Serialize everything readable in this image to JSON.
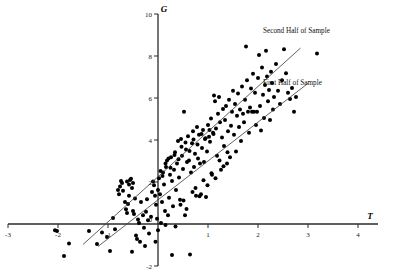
{
  "chart_data": {
    "type": "scatter",
    "title": "",
    "xlabel": "T",
    "ylabel": "G",
    "xlim": [
      -3,
      4
    ],
    "ylim": [
      -2,
      10
    ],
    "xticks": [
      -3,
      -2,
      -1,
      0,
      1,
      2,
      3,
      4
    ],
    "yticks": [
      -2,
      0,
      2,
      4,
      6,
      8,
      10
    ],
    "xtick_labels": [
      "-3",
      "-2",
      "-1",
      "0",
      "1",
      "2",
      "3",
      "4"
    ],
    "ytick_labels": [
      "-2",
      "0",
      "2",
      "4",
      "6",
      "8",
      "10"
    ],
    "grid": false,
    "legend_position": "in-plot-right",
    "series": [
      {
        "name": "Second Half of Sample",
        "type": "line",
        "kind": "regression-fit",
        "slope": 2.15,
        "intercept": 2.25,
        "x_start": -1.5,
        "x_end": 2.85,
        "label_x": 2.1,
        "label_y": 9.1
      },
      {
        "name": "First Half of Sample",
        "type": "line",
        "kind": "regression-fit",
        "slope": 1.85,
        "intercept": 1.15,
        "x_start": -1.2,
        "x_end": 3.0,
        "label_x": 2.1,
        "label_y": 6.6
      },
      {
        "name": "observations",
        "type": "scatter",
        "marker": "filled-circle",
        "color": "#000000",
        "points": [
          [
            -2.02,
            -0.33
          ],
          [
            -1.78,
            -0.93
          ],
          [
            -2.06,
            -0.3
          ],
          [
            -1.38,
            -0.33
          ],
          [
            -1.22,
            -0.95
          ],
          [
            -1.12,
            -0.4
          ],
          [
            -1.02,
            -0.62
          ],
          [
            -0.96,
            -1.28
          ],
          [
            -0.9,
            0.28
          ],
          [
            -0.86,
            -0.25
          ],
          [
            -0.8,
            1.62
          ],
          [
            -0.78,
            1.42
          ],
          [
            -0.76,
            1.78
          ],
          [
            -0.74,
            2.05
          ],
          [
            -0.72,
            1.95
          ],
          [
            -0.7,
            1.58
          ],
          [
            -0.66,
            1.05
          ],
          [
            -0.64,
            0.7
          ],
          [
            -0.62,
            0.52
          ],
          [
            -0.6,
            0.95
          ],
          [
            -0.58,
            1.35
          ],
          [
            -0.56,
            2.1
          ],
          [
            -0.52,
            1.72
          ],
          [
            -0.5,
            0.62
          ],
          [
            -0.48,
            0.48
          ],
          [
            -0.46,
            1.22
          ],
          [
            -0.44,
            -0.55
          ],
          [
            -0.42,
            -0.72
          ],
          [
            -0.4,
            0.22
          ],
          [
            -0.38,
            0.05
          ],
          [
            -0.36,
            -0.85
          ],
          [
            -0.34,
            1.05
          ],
          [
            -0.3,
            0.42
          ],
          [
            -0.28,
            -0.18
          ],
          [
            -0.26,
            -1.05
          ],
          [
            -0.24,
            0.58
          ],
          [
            -0.22,
            1.18
          ],
          [
            -0.2,
            0.18
          ],
          [
            -0.18,
            -0.45
          ],
          [
            -0.14,
            0.35
          ],
          [
            -0.12,
            1.52
          ],
          [
            -0.1,
            2.02
          ],
          [
            -0.08,
            1.85
          ],
          [
            -0.06,
            1.35
          ],
          [
            -0.04,
            0.92
          ],
          [
            -0.02,
            0.25
          ],
          [
            0.0,
            -0.3
          ],
          [
            0.0,
            1.62
          ],
          [
            0.02,
            2.18
          ],
          [
            0.04,
            1.42
          ],
          [
            0.06,
            0.05
          ],
          [
            0.08,
            1.05
          ],
          [
            0.1,
            2.45
          ],
          [
            0.12,
            1.88
          ],
          [
            0.14,
            0.62
          ],
          [
            0.16,
            2.72
          ],
          [
            0.18,
            3.02
          ],
          [
            0.2,
            0.42
          ],
          [
            0.22,
            1.25
          ],
          [
            0.24,
            2.35
          ],
          [
            0.26,
            3.18
          ],
          [
            0.28,
            2.05
          ],
          [
            0.3,
            0.85
          ],
          [
            0.32,
            2.58
          ],
          [
            0.34,
            3.42
          ],
          [
            0.36,
            1.62
          ],
          [
            0.38,
            2.88
          ],
          [
            0.4,
            3.95
          ],
          [
            0.42,
            2.22
          ],
          [
            0.44,
            1.15
          ],
          [
            0.46,
            4.05
          ],
          [
            0.48,
            3.25
          ],
          [
            0.5,
            2.62
          ],
          [
            0.52,
            5.35
          ],
          [
            0.54,
            0.42
          ],
          [
            0.56,
            3.55
          ],
          [
            0.58,
            2.95
          ],
          [
            0.6,
            4.18
          ],
          [
            0.62,
            3.02
          ],
          [
            0.64,
            -1.45
          ],
          [
            0.66,
            2.45
          ],
          [
            0.68,
            3.85
          ],
          [
            0.7,
            4.42
          ],
          [
            0.72,
            2.72
          ],
          [
            0.74,
            3.35
          ],
          [
            0.76,
            1.35
          ],
          [
            0.78,
            4.62
          ],
          [
            0.8,
            3.12
          ],
          [
            0.82,
            4.25
          ],
          [
            0.84,
            2.88
          ],
          [
            0.86,
            1.42
          ],
          [
            0.88,
            3.62
          ],
          [
            0.9,
            4.48
          ],
          [
            0.92,
            2.95
          ],
          [
            0.94,
            4.05
          ],
          [
            0.96,
            1.28
          ],
          [
            0.98,
            3.45
          ],
          [
            1.0,
            4.72
          ],
          [
            1.02,
            4.15
          ],
          [
            1.04,
            3.92
          ],
          [
            1.06,
            5.02
          ],
          [
            1.08,
            2.35
          ],
          [
            1.1,
            4.35
          ],
          [
            1.12,
            6.12
          ],
          [
            1.14,
            5.85
          ],
          [
            1.16,
            4.55
          ],
          [
            1.18,
            3.25
          ],
          [
            1.2,
            5.25
          ],
          [
            1.22,
            6.05
          ],
          [
            1.24,
            4.85
          ],
          [
            1.26,
            2.58
          ],
          [
            1.28,
            4.12
          ],
          [
            1.3,
            5.48
          ],
          [
            1.32,
            3.72
          ],
          [
            1.34,
            4.95
          ],
          [
            1.36,
            5.62
          ],
          [
            1.38,
            2.88
          ],
          [
            1.4,
            4.42
          ],
          [
            1.42,
            5.92
          ],
          [
            1.44,
            3.18
          ],
          [
            1.46,
            4.68
          ],
          [
            1.48,
            5.35
          ],
          [
            1.5,
            6.35
          ],
          [
            1.52,
            4.25
          ],
          [
            1.54,
            5.72
          ],
          [
            1.56,
            3.45
          ],
          [
            1.58,
            5.15
          ],
          [
            1.6,
            6.22
          ],
          [
            1.62,
            4.62
          ],
          [
            1.64,
            5.45
          ],
          [
            1.66,
            3.95
          ],
          [
            1.68,
            6.55
          ],
          [
            1.7,
            5.25
          ],
          [
            1.72,
            4.85
          ],
          [
            1.74,
            5.92
          ],
          [
            1.76,
            8.45
          ],
          [
            1.78,
            6.85
          ],
          [
            1.8,
            5.35
          ],
          [
            1.82,
            4.35
          ],
          [
            1.84,
            5.55
          ],
          [
            1.86,
            6.45
          ],
          [
            1.88,
            5.35
          ],
          [
            1.9,
            7.15
          ],
          [
            1.92,
            5.35
          ],
          [
            1.94,
            6.25
          ],
          [
            1.96,
            4.72
          ],
          [
            1.98,
            5.35
          ],
          [
            2.0,
            6.95
          ],
          [
            2.02,
            8.05
          ],
          [
            2.04,
            5.62
          ],
          [
            2.06,
            4.45
          ],
          [
            2.08,
            7.45
          ],
          [
            2.1,
            6.15
          ],
          [
            2.12,
            5.05
          ],
          [
            2.14,
            6.62
          ],
          [
            2.16,
            8.25
          ],
          [
            2.18,
            7.02
          ],
          [
            2.2,
            5.85
          ],
          [
            2.22,
            6.38
          ],
          [
            2.24,
            4.95
          ],
          [
            2.26,
            7.25
          ],
          [
            2.28,
            6.72
          ],
          [
            2.3,
            5.45
          ],
          [
            2.32,
            6.05
          ],
          [
            2.36,
            7.62
          ],
          [
            2.4,
            6.35
          ],
          [
            2.44,
            5.72
          ],
          [
            2.48,
            6.85
          ],
          [
            2.52,
            8.32
          ],
          [
            2.56,
            7.18
          ],
          [
            2.6,
            6.25
          ],
          [
            2.64,
            5.95
          ],
          [
            2.68,
            6.48
          ],
          [
            2.72,
            5.35
          ],
          [
            2.76,
            6.05
          ],
          [
            3.18,
            8.12
          ],
          [
            -0.62,
            2.02
          ],
          [
            -0.58,
            1.88
          ],
          [
            -0.54,
            2.15
          ],
          [
            -0.5,
            1.95
          ],
          [
            0.05,
            2.52
          ],
          [
            0.09,
            2.28
          ],
          [
            0.15,
            2.88
          ],
          [
            0.21,
            3.12
          ],
          [
            0.25,
            2.68
          ],
          [
            0.33,
            3.28
          ],
          [
            0.41,
            3.08
          ],
          [
            0.47,
            3.68
          ],
          [
            0.55,
            3.88
          ],
          [
            0.63,
            3.48
          ],
          [
            0.71,
            4.02
          ],
          [
            0.79,
            3.78
          ],
          [
            0.87,
            4.28
          ],
          [
            0.95,
            4.08
          ],
          [
            1.03,
            4.48
          ],
          [
            1.11,
            4.28
          ],
          [
            0.45,
            0.92
          ],
          [
            0.51,
            1.12
          ],
          [
            0.57,
            0.72
          ],
          [
            0.69,
            1.52
          ],
          [
            0.75,
            1.72
          ],
          [
            0.83,
            1.32
          ],
          [
            0.91,
            2.08
          ],
          [
            0.99,
            1.85
          ],
          [
            1.07,
            2.42
          ],
          [
            1.15,
            2.18
          ],
          [
            1.23,
            3.02
          ],
          [
            1.31,
            2.75
          ],
          [
            1.39,
            3.42
          ],
          [
            -1.88,
            -1.52
          ],
          [
            -0.52,
            -1.32
          ],
          [
            0.28,
            -1.48
          ],
          [
            0.15,
            -0.05
          ],
          [
            0.35,
            -0.12
          ],
          [
            -0.05,
            -0.85
          ]
        ]
      }
    ]
  },
  "axes": {
    "x_axis_label": "T",
    "y_axis_label": "G"
  },
  "caption": {
    "text": ""
  }
}
